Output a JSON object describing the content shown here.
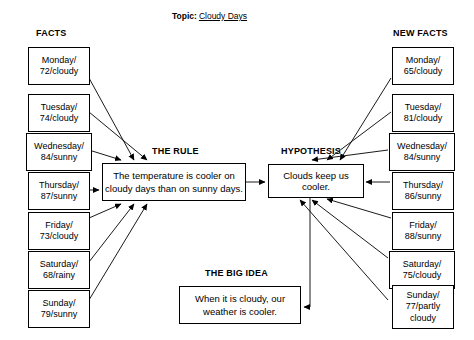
{
  "topic": {
    "label": "Topic:",
    "value": "Cloudy Days"
  },
  "headings": {
    "facts": "FACTS",
    "new_facts": "NEW FACTS",
    "the_rule": "THE RULE",
    "hypothesis": "HYPOTHESIS",
    "the_big_idea": "THE BIG IDEA"
  },
  "facts": [
    {
      "line1": "Monday/",
      "line2": "72/cloudy"
    },
    {
      "line1": "Tuesday/",
      "line2": "74/cloudy"
    },
    {
      "line1": "Wednesday/",
      "line2": "84/sunny"
    },
    {
      "line1": "Thursday/",
      "line2": "87/sunny"
    },
    {
      "line1": "Friday/",
      "line2": "73/cloudy"
    },
    {
      "line1": "Saturday/",
      "line2": "68/rainy"
    },
    {
      "line1": "Sunday/",
      "line2": "79/sunny"
    }
  ],
  "new_facts": [
    {
      "line1": "Monday/",
      "line2": "65/cloudy",
      "line3": ""
    },
    {
      "line1": "Tuesday/",
      "line2": "81/cloudy",
      "line3": ""
    },
    {
      "line1": "Wednesday/",
      "line2": "84/sunny",
      "line3": ""
    },
    {
      "line1": "Thursday/",
      "line2": "86/sunny",
      "line3": ""
    },
    {
      "line1": "Friday/",
      "line2": "88/sunny",
      "line3": ""
    },
    {
      "line1": "Saturday/",
      "line2": "75/cloudy",
      "line3": ""
    },
    {
      "line1": "Sunday/",
      "line2": "77/partly",
      "line3": "cloudy"
    }
  ],
  "rule": {
    "line1": "The temperature is cooler on",
    "line2": "cloudy days than on sunny days."
  },
  "hypothesis": {
    "text": "Clouds keep us cooler."
  },
  "big_idea": {
    "line1": "When it is cloudy, our",
    "line2": "weather is cooler."
  },
  "colors": {
    "stroke": "#000000",
    "background": "#ffffff",
    "text": "#000000"
  }
}
